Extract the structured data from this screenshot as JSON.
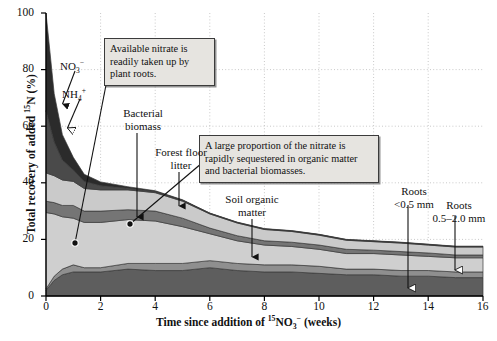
{
  "chart_data": {
    "type": "area",
    "stacked": true,
    "title": "",
    "xlabel_parts": {
      "pre": "Time since addition of ",
      "sup1": "15",
      "base": "NO",
      "sub": "3",
      "sup2": "−",
      "post": " (weeks)"
    },
    "ylabel_parts": {
      "pre": "Total recovery of added ",
      "sup": "15",
      "post": "N (%)"
    },
    "xlabel_plain": "Time since addition of 15NO3- (weeks)",
    "ylabel_plain": "Total recovery of added 15N (%)",
    "xlim": [
      0,
      16
    ],
    "ylim": [
      0,
      100
    ],
    "xticks": [
      0,
      2,
      4,
      6,
      8,
      10,
      12,
      14,
      16
    ],
    "yticks": [
      0,
      20,
      40,
      60,
      80,
      100
    ],
    "grid": "dotted-light",
    "legend": "inline-annotations",
    "x": [
      0,
      0.3,
      0.6,
      1,
      1.4,
      2,
      3,
      4,
      5,
      6,
      7,
      8,
      9,
      10,
      11,
      12,
      13,
      14,
      15,
      16
    ],
    "series": [
      {
        "name": "Roots 0.5–2.0 mm",
        "color": "#5e5e5e",
        "values": [
          2,
          5.5,
          7.5,
          8.5,
          8.5,
          8.5,
          9.5,
          9,
          9,
          10,
          9,
          8.5,
          8.5,
          8,
          7.5,
          7.5,
          7,
          7,
          6.5,
          6.5
        ]
      },
      {
        "name": "Roots <0.5 mm",
        "color": "#8f8f8f",
        "values": [
          0.5,
          1.5,
          2,
          2.5,
          1.5,
          1.5,
          2,
          2.5,
          2.5,
          2.5,
          2.5,
          2.5,
          2.5,
          2.5,
          2,
          2,
          2,
          2,
          2,
          2
        ]
      },
      {
        "name": "Soil organic matter",
        "color": "#cfcfcf",
        "values": [
          27,
          22,
          18.5,
          16.5,
          16,
          16,
          15.5,
          15,
          13,
          9.5,
          8,
          7,
          6.5,
          6,
          5.5,
          5.5,
          5.5,
          5,
          5,
          5
        ]
      },
      {
        "name": "Forest floor litter",
        "color": "#757575",
        "values": [
          4,
          4,
          4,
          4.5,
          4,
          4,
          3.5,
          3.5,
          3,
          2,
          1.8,
          1.5,
          1.5,
          1.5,
          1.5,
          1.2,
          1.2,
          1.2,
          1,
          1
        ]
      },
      {
        "name": "Bacterial biomass",
        "color": "#cacaca",
        "values": [
          10,
          9.5,
          9,
          8.5,
          8,
          7.5,
          7,
          6.5,
          6,
          5,
          4.5,
          4,
          3.8,
          3.5,
          3.2,
          3,
          3,
          2.8,
          2.8,
          2.8
        ]
      },
      {
        "name": "NH4+",
        "color": "#4a4a4a",
        "values": [
          22,
          12,
          7,
          4,
          2.5,
          1.5,
          0.6,
          0.4,
          0.3,
          0.2,
          0.2,
          0.2,
          0.2,
          0.2,
          0.2,
          0.2,
          0.2,
          0.2,
          0.2,
          0.2
        ]
      },
      {
        "name": "NO3−",
        "color": "#2b2b2b",
        "values": [
          34.5,
          17,
          9,
          4.5,
          2.5,
          1.3,
          0.5,
          0.3,
          0.2,
          0.1,
          0.1,
          0.1,
          0.1,
          0.1,
          0.1,
          0.1,
          0.1,
          0.1,
          0.1,
          0.1
        ]
      }
    ],
    "series_labels": [
      {
        "id": "no3",
        "text": "NO3−",
        "base": "NO",
        "sub": "3",
        "sup": "−"
      },
      {
        "id": "nh4",
        "text": "NH4+",
        "base": "NH",
        "sub": "4",
        "sup": "+"
      },
      {
        "id": "bacterial",
        "line1": "Bacterial",
        "line2": "biomass"
      },
      {
        "id": "forest-floor",
        "line1": "Forest floor",
        "line2": "litter"
      },
      {
        "id": "soil-organic",
        "line1": "Soil organic",
        "line2": "matter"
      },
      {
        "id": "roots-fine",
        "line1": "Roots",
        "line2": "<0.5 mm"
      },
      {
        "id": "roots-coarse",
        "line1": "Roots",
        "line2": "0.5–2.0 mm"
      }
    ],
    "annotations": [
      {
        "id": "nitrate-uptake",
        "text": "Available nitrate is readily taken up by plant roots."
      },
      {
        "id": "sequestration",
        "text": "A large proportion of the nitrate is rapidly sequestered in organic matter and bacterial biomasses."
      }
    ],
    "colors": {
      "no3": "#2b2b2b",
      "nh4": "#4a4a4a",
      "bacterial_biomass": "#cacaca",
      "forest_floor_litter": "#757575",
      "soil_organic_matter": "#cfcfcf",
      "roots_fine": "#8f8f8f",
      "roots_coarse": "#5e5e5e",
      "callout_bg": "#e6e4e0",
      "callout_border": "#3b3b3b",
      "axis": "#000000",
      "grid": "#cccccc"
    }
  },
  "axes": {
    "yticks": [
      "0",
      "20",
      "40",
      "60",
      "80",
      "100"
    ],
    "xticks": [
      "0",
      "2",
      "4",
      "6",
      "8",
      "10",
      "12",
      "14",
      "16"
    ]
  },
  "labels": {
    "no3_base": "NO",
    "no3_sub": "3",
    "no3_sup": "−",
    "nh4_base": "NH",
    "nh4_sub": "4",
    "nh4_sup": "+",
    "bacterial_l1": "Bacterial",
    "bacterial_l2": "biomass",
    "ffl_l1": "Forest floor",
    "ffl_l2": "litter",
    "som_l1": "Soil organic",
    "som_l2": "matter",
    "rootsA_l1": "Roots",
    "rootsA_l2": "<0.5 mm",
    "rootsB_l1": "Roots",
    "rootsB_l2": "0.5–2.0 mm"
  },
  "callouts": {
    "nitrate": "Available nitrate is readily taken up by plant roots.",
    "sequestered": "A large proportion of the nitrate is rapidly sequestered in organic matter and bacterial biomasses."
  },
  "axis_titles": {
    "y_pre": "Total recovery of added ",
    "y_sup": "15",
    "y_post": "N (%)",
    "x_pre": "Time since addition of ",
    "x_sup1": "15",
    "x_base": "NO",
    "x_sub": "3",
    "x_sup2": "−",
    "x_post": " (weeks)"
  }
}
